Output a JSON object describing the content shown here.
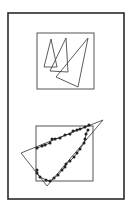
{
  "colors": {
    "background": "#ffffff",
    "outer_frame": "#2a2a2a",
    "box_stroke": "#555555",
    "shape_stroke": "#4a4a4a",
    "dot_fill": "#222222"
  },
  "outer_frame": {
    "x": 8,
    "y": 13,
    "w": 116,
    "h": 186,
    "stroke_width": 1.6
  },
  "top_panel": {
    "box": {
      "x": 37,
      "y": 33,
      "w": 57,
      "h": 56
    },
    "triangles": [
      {
        "points": [
          [
            51,
            39
          ],
          [
            44,
            67
          ],
          [
            57,
            67
          ]
        ]
      },
      {
        "points": [
          [
            66,
            38
          ],
          [
            50,
            71
          ],
          [
            68,
            72
          ]
        ]
      },
      {
        "points": [
          [
            88,
            38
          ],
          [
            56,
            77
          ],
          [
            78,
            87
          ]
        ]
      }
    ]
  },
  "bottom_panel": {
    "box": {
      "x": 36,
      "y": 126,
      "w": 57,
      "h": 55
    },
    "triangle": {
      "points": [
        [
          103,
          120
        ],
        [
          21,
          153
        ],
        [
          47,
          186
        ]
      ]
    },
    "dots": [
      [
        37,
        148
      ],
      [
        42,
        146
      ],
      [
        45,
        145
      ],
      [
        50,
        143
      ],
      [
        52,
        139
      ],
      [
        55,
        139
      ],
      [
        60,
        138
      ],
      [
        65,
        135
      ],
      [
        70,
        134
      ],
      [
        73,
        131
      ],
      [
        77,
        130
      ],
      [
        80,
        129
      ],
      [
        85,
        127
      ],
      [
        89,
        125
      ],
      [
        88,
        130
      ],
      [
        86,
        134
      ],
      [
        85,
        139
      ],
      [
        84,
        143
      ],
      [
        80,
        149
      ],
      [
        77,
        153
      ],
      [
        74,
        157
      ],
      [
        70,
        161
      ],
      [
        66,
        164
      ],
      [
        65,
        167
      ],
      [
        62,
        170
      ],
      [
        58,
        175
      ],
      [
        54,
        178
      ],
      [
        50,
        181
      ],
      [
        46,
        180
      ],
      [
        40,
        177
      ],
      [
        37,
        173
      ],
      [
        37,
        170
      ]
    ]
  }
}
